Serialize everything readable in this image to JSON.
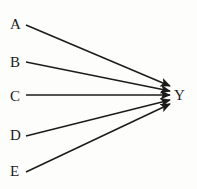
{
  "figure": {
    "type": "directed-graph",
    "background_color": "#fdfdfc",
    "stroke_color": "#1b1b1b",
    "text_color": "#1b1b1b",
    "width": 197,
    "height": 189
  },
  "nodes": {
    "sources": [
      {
        "id": "A",
        "label": "A",
        "x": 10,
        "y": 17
      },
      {
        "id": "B",
        "label": "B",
        "x": 10,
        "y": 55
      },
      {
        "id": "C",
        "label": "C",
        "x": 10,
        "y": 89
      },
      {
        "id": "D",
        "label": "D",
        "x": 10,
        "y": 128
      },
      {
        "id": "E",
        "label": "E",
        "x": 10,
        "y": 164
      }
    ],
    "target": {
      "id": "Y",
      "label": "Y",
      "x": 174,
      "y": 88
    }
  },
  "edges": [
    {
      "id": "A-Y",
      "from": "A",
      "to": "Y",
      "x1": 26,
      "y1": 25,
      "x2": 170,
      "y2": 86
    },
    {
      "id": "B-Y",
      "from": "B",
      "to": "Y",
      "x1": 26,
      "y1": 62,
      "x2": 170,
      "y2": 91
    },
    {
      "id": "C-Y",
      "from": "C",
      "to": "Y",
      "x1": 26,
      "y1": 95,
      "x2": 170,
      "y2": 95
    },
    {
      "id": "D-Y",
      "from": "D",
      "to": "Y",
      "x1": 26,
      "y1": 136,
      "x2": 170,
      "y2": 100
    },
    {
      "id": "E-Y",
      "from": "E",
      "to": "Y",
      "x1": 26,
      "y1": 172,
      "x2": 170,
      "y2": 104
    }
  ]
}
